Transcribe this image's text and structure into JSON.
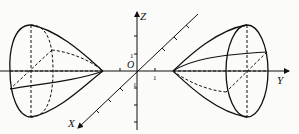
{
  "figure": {
    "type": "hyperboloid of two sheets",
    "axes": {
      "z_label": "Z",
      "y_label": "Y",
      "x_label": "X",
      "origin_label": "O",
      "tick_label_z": "1",
      "tick_label_neg_z": "1",
      "tick_label_y": "1"
    },
    "line_color": "#111111",
    "background": "#fbfbfa"
  }
}
